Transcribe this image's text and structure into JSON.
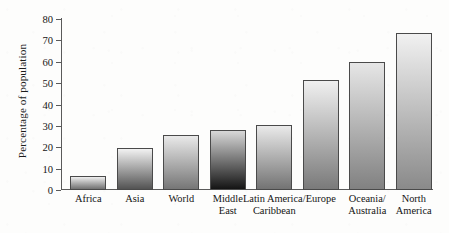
{
  "chart_data": {
    "type": "bar",
    "title": "",
    "xlabel": "",
    "ylabel": "Percentage of population",
    "ylim": [
      0,
      80
    ],
    "ytick_values": [
      80,
      70,
      60,
      50,
      40,
      30,
      20,
      10,
      0
    ],
    "ytick_labels": [
      "80",
      "70",
      "60",
      "50",
      "40",
      "30",
      "20",
      "10",
      "0"
    ],
    "grid": false,
    "legend": "none",
    "categories": [
      "Africa",
      "Asia",
      "World",
      "Middle East",
      "Latin America/ Caribbean",
      "Europe",
      "Oceania/ Australia",
      "North America"
    ],
    "category_lines": [
      {
        "line1": "Africa",
        "line2": ""
      },
      {
        "line1": "Asia",
        "line2": ""
      },
      {
        "line1": "World",
        "line2": ""
      },
      {
        "line1": "Middle",
        "line2": "East"
      },
      {
        "line1": "Latin America/",
        "line2": "Caribbean"
      },
      {
        "line1": "Europe",
        "line2": ""
      },
      {
        "line1": "Oceania/",
        "line2": "Australia"
      },
      {
        "line1": "North",
        "line2": "America"
      }
    ],
    "values": [
      7,
      20,
      26,
      28.5,
      31,
      52,
      60.5,
      74
    ],
    "bar_styles": [
      {
        "top": "#efefef",
        "bottom": "#707070"
      },
      {
        "top": "#f2f2f2",
        "bottom": "#535353"
      },
      {
        "top": "#e9e9e9",
        "bottom": "#767676"
      },
      {
        "top": "#d8d8d8",
        "bottom": "#141414"
      },
      {
        "top": "#eaeaea",
        "bottom": "#737373"
      },
      {
        "top": "#f0f0f0",
        "bottom": "#7a7a7a"
      },
      {
        "top": "#e6e6e6",
        "bottom": "#818181"
      },
      {
        "top": "#f1f1f1",
        "bottom": "#8a8a8a"
      }
    ],
    "axis_color": "#5a5a5a",
    "background_color": "#fdfdfc"
  }
}
